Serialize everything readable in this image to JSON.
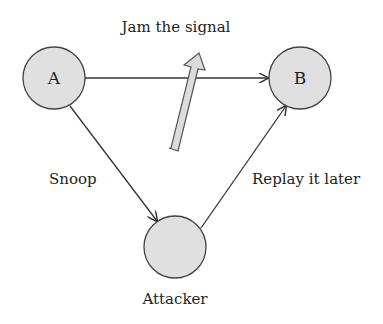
{
  "diagram": {
    "nodes": [
      {
        "id": "A",
        "label": "A",
        "cx": 54,
        "cy": 78,
        "r": 31
      },
      {
        "id": "B",
        "label": "B",
        "cx": 300,
        "cy": 78,
        "r": 31
      },
      {
        "id": "attacker",
        "label": "",
        "cx": 175,
        "cy": 247,
        "r": 31
      }
    ],
    "labels": {
      "jam": "Jam the signal",
      "snoop": "Snoop",
      "replay": "Replay it later",
      "attacker": "Attacker"
    },
    "edges": [
      {
        "from": "A",
        "to": "B",
        "label": ""
      },
      {
        "from": "A",
        "to": "attacker",
        "label": "Snoop"
      },
      {
        "from": "attacker",
        "to": "B",
        "label": "Replay it later"
      }
    ],
    "colors": {
      "node_fill": "#e0e0e0",
      "stroke": "#444444",
      "arrow_fill": "#dcdcdc"
    }
  }
}
